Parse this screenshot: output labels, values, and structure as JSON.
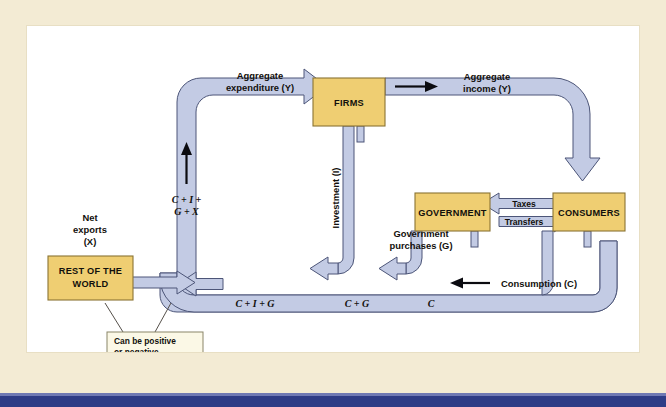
{
  "figure": {
    "type": "circular-flow-diagram"
  },
  "palette": {
    "page_background": "#f3ebd4",
    "canvas_background": "#ffffff",
    "flow_band_fill": "#c3cbe4",
    "flow_band_stroke": "#4c5578",
    "node_fill": "#efce72",
    "node_stroke": "#8a7433",
    "callout_fill": "#fbf8e6",
    "bottom_bar": "#2e3c86",
    "text": "#12100c"
  },
  "nodes": {
    "firms": {
      "label": "FIRMS"
    },
    "government": {
      "label": "GOVERNMENT"
    },
    "consumers": {
      "label": "CONSUMERS"
    },
    "rest_of_world": {
      "label_line1": "REST OF THE",
      "label_line2": "WORLD"
    }
  },
  "flows": {
    "aggregate_expenditure": {
      "line1": "Aggregate",
      "line2": "expenditure (Y)"
    },
    "aggregate_income": {
      "line1": "Aggregate",
      "line2": "income (Y)"
    },
    "investment": {
      "label": "Investment (I)"
    },
    "government_purchases": {
      "line1": "Government",
      "line2": "purchases (G)"
    },
    "consumption": {
      "label": "Consumption (C)"
    },
    "taxes": {
      "label": "Taxes"
    },
    "transfers": {
      "label": "Transfers"
    },
    "net_exports": {
      "line1": "Net",
      "line2": "exports",
      "line3": "(X)"
    }
  },
  "math_labels": {
    "c_i_g_x_line1": "C + I +",
    "c_i_g_x_line2": "G + X",
    "c_i_g": "C + I + G",
    "c_g": "C + G",
    "c": "C"
  },
  "callout": {
    "line1": "Can be positive",
    "line2": "or negative"
  }
}
